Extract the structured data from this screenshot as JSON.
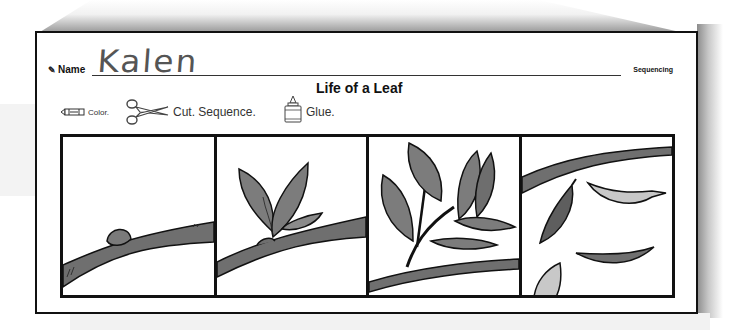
{
  "worksheet": {
    "name_label": "Name",
    "name_value": "Kalen",
    "subject_tag": "Sequencing",
    "title": "Life of a Leaf",
    "instructions": [
      {
        "icon": "crayon-icon",
        "label": "Color."
      },
      {
        "icon": "scissors-icon",
        "label": "Cut. Sequence."
      },
      {
        "icon": "glue-bottle-icon",
        "label": "Glue."
      }
    ],
    "panels": [
      {
        "id": 1,
        "depicts": "bud-on-branch"
      },
      {
        "id": 2,
        "depicts": "sprouting-leaves"
      },
      {
        "id": 3,
        "depicts": "full-grown-leaves"
      },
      {
        "id": 4,
        "depicts": "falling-leaves"
      }
    ],
    "colors": {
      "border": "#111111",
      "branch_fill": "#6f6f6f",
      "leaf_fill": "#7c7c7c",
      "leaf_dark": "#5e5e5e",
      "leaf_light": "#c8c8c8"
    }
  }
}
